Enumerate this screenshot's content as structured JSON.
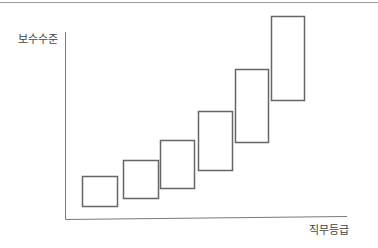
{
  "diagram": {
    "y_axis_label": "보수수준",
    "x_axis_label": "직무등급",
    "axis_color": "#7a7a7a",
    "box_stroke_color": "#666666",
    "boxes": [
      {
        "grade": 1,
        "x": 82,
        "y_top": 176,
        "y_bottom": 206,
        "width": 35
      },
      {
        "grade": 2,
        "x": 123,
        "y_top": 160,
        "y_bottom": 198,
        "width": 35
      },
      {
        "grade": 3,
        "x": 160,
        "y_top": 140,
        "y_bottom": 188,
        "width": 34
      },
      {
        "grade": 4,
        "x": 198,
        "y_top": 111,
        "y_bottom": 170,
        "width": 34
      },
      {
        "grade": 5,
        "x": 235,
        "y_top": 69,
        "y_bottom": 142,
        "width": 33
      },
      {
        "grade": 6,
        "x": 271,
        "y_top": 16,
        "y_bottom": 100,
        "width": 33
      }
    ]
  },
  "chart_data": {
    "type": "range-bar",
    "title": "",
    "xlabel": "직무등급",
    "ylabel": "보수수준",
    "categories": [
      "1",
      "2",
      "3",
      "4",
      "5",
      "6"
    ],
    "series": [
      {
        "name": "min",
        "values": [
          14,
          22,
          32,
          50,
          78,
          120
        ]
      },
      {
        "name": "max",
        "values": [
          44,
          60,
          80,
          109,
          151,
          204
        ]
      }
    ],
    "grid": false,
    "legend": "none"
  }
}
